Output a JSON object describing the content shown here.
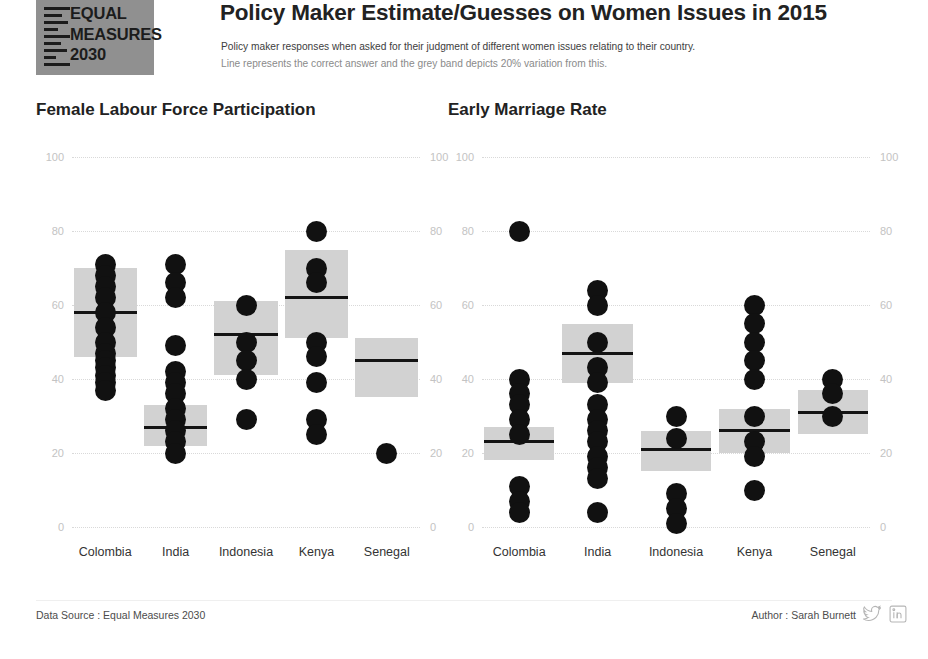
{
  "header": {
    "logo": {
      "name": "equal-measures-2030-logo",
      "line1": "EQUAL",
      "line2": "MEASURES",
      "line3": "2030",
      "bg_color": "#909090"
    },
    "title": "Policy Maker Estimate/Guesses on Women Issues in 2015",
    "subtitle_line1": "Policy maker responses when asked for their judgment of different women issues relating to their country.",
    "subtitle_line2": "Line represents the correct answer and the grey band depicts 20% variation from this."
  },
  "footer": {
    "data_source": "Data Source : Equal Measures 2030",
    "author": "Author : Sarah Burnett",
    "twitter_icon": "twitter-bird-icon",
    "linkedin_icon": "linkedin-icon"
  },
  "colors": {
    "dot": "#111111",
    "band": "#d2d2d2",
    "reference_line": "#141414",
    "gridline": "#d9d9d9",
    "tick_label": "#c3c3c3"
  },
  "chart_data": [
    {
      "type": "scatter",
      "title": "Female Labour Force Participation",
      "xlabel": "",
      "ylabel": "",
      "ylim": [
        0,
        100
      ],
      "yticks": [
        0,
        20,
        40,
        60,
        80,
        100
      ],
      "ytick_labels": [
        "0",
        "20",
        "40",
        "60",
        "80",
        "100"
      ],
      "grid": true,
      "legend": "none",
      "categories": [
        "Colombia",
        "India",
        "Indonesia",
        "Kenya",
        "Senegal"
      ],
      "series": [
        {
          "name": "Colombia",
          "correct_answer": 58,
          "band": [
            46,
            70
          ],
          "values": [
            71,
            68,
            65,
            62,
            58,
            54,
            50,
            47,
            45,
            43,
            41,
            39,
            37
          ]
        },
        {
          "name": "India",
          "correct_answer": 27,
          "band": [
            22,
            33
          ],
          "values": [
            71,
            66,
            62,
            49,
            42,
            39,
            36,
            32,
            29,
            26,
            23,
            20
          ]
        },
        {
          "name": "Indonesia",
          "correct_answer": 52,
          "band": [
            41,
            61
          ],
          "values": [
            60,
            50,
            45,
            40,
            29
          ]
        },
        {
          "name": "Kenya",
          "correct_answer": 62,
          "band": [
            51,
            75
          ],
          "values": [
            80,
            70,
            66,
            50,
            46,
            39,
            29,
            25
          ]
        },
        {
          "name": "Senegal",
          "correct_answer": 45,
          "band": [
            35,
            51
          ],
          "values": [
            20
          ]
        }
      ]
    },
    {
      "type": "scatter",
      "title": "Early Marriage Rate",
      "xlabel": "",
      "ylabel": "",
      "ylim": [
        0,
        100
      ],
      "yticks": [
        0,
        20,
        40,
        60,
        80,
        100
      ],
      "ytick_labels": [
        "0",
        "20",
        "40",
        "60",
        "80",
        "100"
      ],
      "grid": true,
      "legend": "none",
      "categories": [
        "Colombia",
        "India",
        "Indonesia",
        "Kenya",
        "Senegal"
      ],
      "series": [
        {
          "name": "Colombia",
          "correct_answer": 23,
          "band": [
            18,
            27
          ],
          "values": [
            80,
            40,
            36,
            33,
            29,
            25,
            11,
            7,
            4
          ]
        },
        {
          "name": "India",
          "correct_answer": 47,
          "band": [
            39,
            55
          ],
          "values": [
            64,
            60,
            50,
            43,
            39,
            33,
            29,
            26,
            23,
            19,
            16,
            13,
            4
          ]
        },
        {
          "name": "Indonesia",
          "correct_answer": 21,
          "band": [
            15,
            26
          ],
          "values": [
            30,
            24,
            9,
            5,
            1
          ]
        },
        {
          "name": "Kenya",
          "correct_answer": 26,
          "band": [
            20,
            32
          ],
          "values": [
            60,
            55,
            50,
            45,
            40,
            30,
            23,
            19,
            10
          ]
        },
        {
          "name": "Senegal",
          "correct_answer": 31,
          "band": [
            25,
            37
          ],
          "values": [
            40,
            36,
            30
          ]
        }
      ]
    }
  ]
}
